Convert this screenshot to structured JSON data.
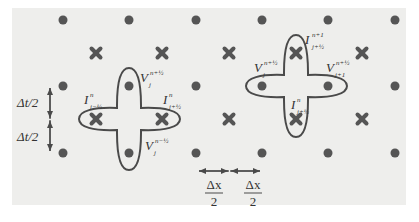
{
  "colors": {
    "background": "#ffffff",
    "panel": "#eeeeec",
    "dot": "#555555",
    "cross": "#555555",
    "contour": "#4a4a4a",
    "text": "#333333"
  },
  "grid": {
    "dot_columns_x": [
      63,
      129,
      196,
      262,
      328,
      395
    ],
    "dot_rows_y": [
      20,
      86,
      153
    ],
    "cross_columns_x": [
      96,
      162,
      229,
      296,
      362
    ],
    "cross_rows_y": [
      53,
      119
    ]
  },
  "left_stencil": {
    "labels": {
      "v_top": {
        "base": "V",
        "sup": "n+½",
        "sub": "j"
      },
      "i_left": {
        "base": "I",
        "sup": "n",
        "sub": "j−½"
      },
      "i_right": {
        "base": "I",
        "sup": "n",
        "sub": "j+½"
      },
      "v_bottom": {
        "base": "V",
        "sup": "n−½",
        "sub": "j"
      }
    }
  },
  "right_stencil": {
    "labels": {
      "i_top": {
        "base": "I",
        "sup": "n+1",
        "sub": "j+½"
      },
      "v_left": {
        "base": "V",
        "sup": "n+½",
        "sub": "j"
      },
      "v_right": {
        "base": "V",
        "sup": "n+½",
        "sub": "j+1"
      },
      "i_bottom": {
        "base": "I",
        "sup": "n",
        "sub": "j+½"
      }
    }
  },
  "dimensions": {
    "dt_upper": "Δt/2",
    "dt_lower": "Δt/2",
    "dx_left": {
      "num": "Δx",
      "den": "2"
    },
    "dx_right": {
      "num": "Δx",
      "den": "2"
    }
  }
}
